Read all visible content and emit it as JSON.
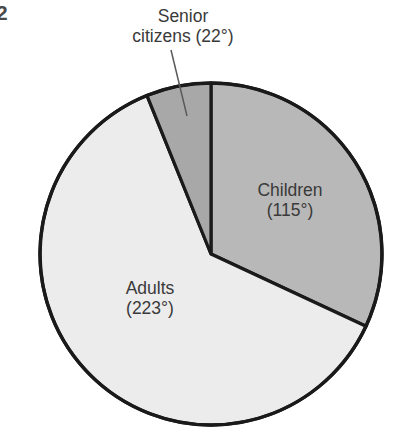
{
  "figure": {
    "number": "2"
  },
  "chart_data": {
    "type": "pie",
    "title": "",
    "subtitle": "",
    "xlabel": "",
    "ylabel": "",
    "units": "degrees",
    "total_degrees": 360,
    "legend_position": "none",
    "grid": false,
    "start_angle_deg": 0,
    "direction": "clockwise",
    "categories": [
      "Children",
      "Adults",
      "Senior citizens"
    ],
    "values": [
      115,
      223,
      22
    ],
    "labels": [
      "Children (115°)",
      "Adults (223°)",
      "Senior citizens (22°)"
    ],
    "slices": [
      {
        "name": "Children",
        "value": 115,
        "value_text": "(115°)",
        "label_line1": "Children",
        "label_line2": "(115°)",
        "color": "#b8b8b8",
        "label_placement": "inside",
        "start_deg": 0,
        "end_deg": 115
      },
      {
        "name": "Adults",
        "value": 223,
        "value_text": "(223°)",
        "label_line1": "Adults",
        "label_line2": "(223°)",
        "color": "#ececec",
        "label_placement": "inside",
        "start_deg": 115,
        "end_deg": 338
      },
      {
        "name": "Senior citizens",
        "value": 22,
        "value_text": "(22°)",
        "label_line1": "Senior",
        "label_line2": "citizens (22°)",
        "color": "#a8a8a8",
        "label_placement": "outside-callout",
        "start_deg": 338,
        "end_deg": 360
      }
    ],
    "stroke_color": "#1a1a1a",
    "background": "#ffffff"
  }
}
